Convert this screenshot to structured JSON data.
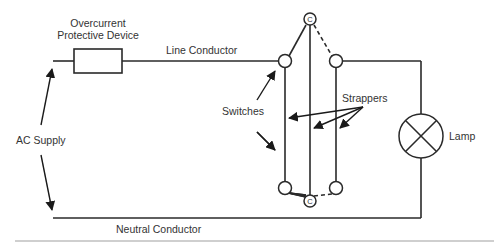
{
  "diagram": {
    "labels": {
      "overcurrent_line1": "Overcurrent",
      "overcurrent_line2": "Protective Device",
      "line_conductor": "Line Conductor",
      "neutral_conductor": "Neutral Conductor",
      "ac_supply": "AC Supply",
      "switches": "Switches",
      "strappers": "Strappers",
      "lamp": "Lamp",
      "common_top": "C",
      "common_bottom": "C"
    },
    "components": [
      {
        "id": "ac-supply",
        "type": "source",
        "label": "AC Supply"
      },
      {
        "id": "fuse",
        "type": "overcurrent-protective-device",
        "label": "Overcurrent Protective Device"
      },
      {
        "id": "switch-1",
        "type": "two-way-switch",
        "common": "C"
      },
      {
        "id": "switch-2",
        "type": "two-way-switch",
        "common": "C"
      },
      {
        "id": "lamp",
        "type": "lamp",
        "label": "Lamp"
      }
    ],
    "connections": [
      {
        "from": "ac-supply",
        "to": "fuse",
        "via": "Line Conductor"
      },
      {
        "from": "fuse",
        "to": "switch-1",
        "via": "Line Conductor"
      },
      {
        "from": "switch-1",
        "to": "switch-2",
        "via": "Strappers",
        "count": 2
      },
      {
        "from": "switch-2",
        "to": "lamp"
      },
      {
        "from": "lamp",
        "to": "ac-supply",
        "via": "Neutral Conductor"
      }
    ],
    "colors": {
      "line": "#2a2a2a",
      "text": "#333333",
      "background": "#ffffff",
      "separator": "#cfcfcf"
    }
  }
}
